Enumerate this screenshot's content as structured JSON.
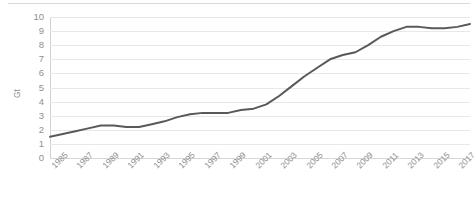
{
  "chart_data": {
    "type": "line",
    "title": "",
    "subtitle": "",
    "xlabel": "",
    "ylabel": "Gt",
    "legend": [],
    "legend_position": "none",
    "grid": true,
    "xlim": [
      1985,
      2018
    ],
    "ylim": [
      0,
      10
    ],
    "y_ticks": [
      0,
      1,
      2,
      3,
      4,
      5,
      6,
      7,
      8,
      9,
      10
    ],
    "y_tick_labels": [
      "0",
      "1",
      "2",
      "3",
      "4",
      "5",
      "6",
      "7",
      "8",
      "9",
      "10"
    ],
    "x_tick_labels": [
      "1985",
      "1987",
      "1989",
      "1991",
      "1993",
      "1995",
      "1997",
      "1999",
      "2001",
      "2003",
      "2005",
      "2007",
      "2009",
      "2011",
      "2013",
      "2015",
      "2017"
    ],
    "series": [
      {
        "name": "emissions",
        "color": "#595959",
        "line_width": 2,
        "x": [
          1985,
          1986,
          1987,
          1988,
          1989,
          1990,
          1991,
          1992,
          1993,
          1994,
          1995,
          1996,
          1997,
          1998,
          1999,
          2000,
          2001,
          2002,
          2003,
          2004,
          2005,
          2006,
          2007,
          2008,
          2009,
          2010,
          2011,
          2012,
          2013,
          2014,
          2015,
          2016,
          2017,
          2018
        ],
        "values": [
          1.5,
          1.7,
          1.9,
          2.1,
          2.3,
          2.3,
          2.2,
          2.2,
          2.4,
          2.6,
          2.9,
          3.1,
          3.2,
          3.2,
          3.2,
          3.4,
          3.5,
          3.8,
          4.4,
          5.1,
          5.8,
          6.4,
          7.0,
          7.3,
          7.5,
          8.0,
          8.6,
          9.0,
          9.3,
          9.3,
          9.2,
          9.2,
          9.3,
          9.5
        ]
      }
    ]
  },
  "axes": {
    "y_axis_title": "Gt"
  }
}
